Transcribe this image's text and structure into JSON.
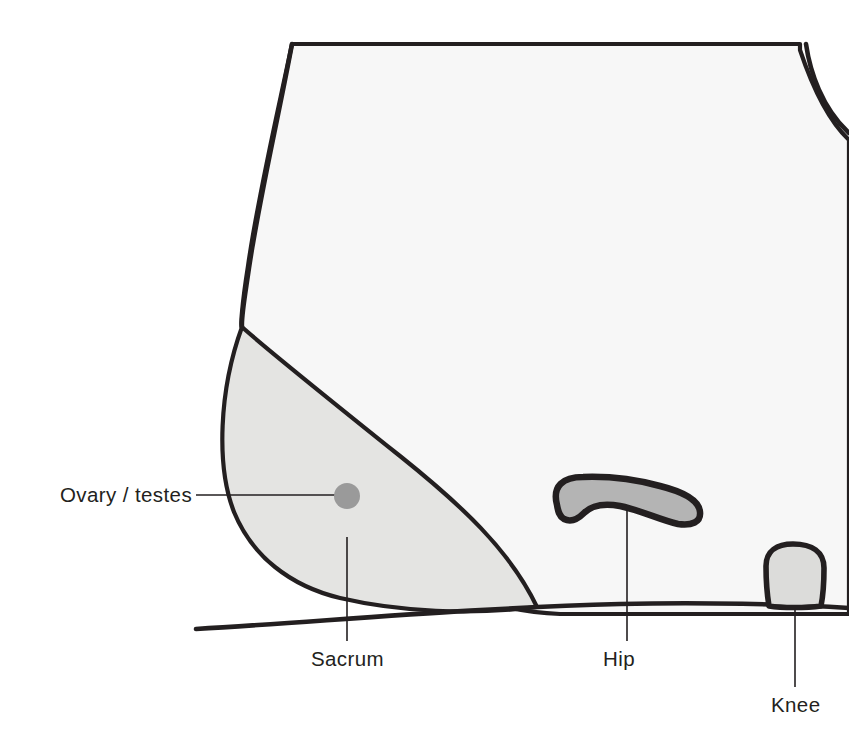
{
  "diagram": {
    "canvas": {
      "width": 849,
      "height": 751
    },
    "colors": {
      "outline": "#231f20",
      "body_fill": "#f7f7f7",
      "sacrum_fill": "#e4e4e2",
      "hip_fill": "#b4b4b4",
      "knee_fill": "#dcdcda",
      "ovary_fill": "#9a9a9a",
      "background": "#ffffff"
    },
    "labels": [
      {
        "id": "ovary-testes",
        "text": "Ovary / testes",
        "text_x": 60,
        "text_y": 502,
        "anchor": "start",
        "leader": "M196,495 L336,495"
      },
      {
        "id": "sacrum",
        "text": "Sacrum",
        "text_x": 311,
        "text_y": 666,
        "anchor": "start",
        "leader": "M347,537 L347,641"
      },
      {
        "id": "hip",
        "text": "Hip",
        "text_x": 603,
        "text_y": 666,
        "anchor": "start",
        "leader": "M627,488 L627,641"
      },
      {
        "id": "knee",
        "text": "Knee",
        "text_x": 771,
        "text_y": 712,
        "anchor": "start",
        "leader": "M795,570 L795,687"
      }
    ],
    "shapes": {
      "body": {
        "name": "torso-and-thigh-outline",
        "path": "M292,44 C276,120 258,196 248,266 C242,304 240,330 242,327 C250,420 300,520 420,578 C470,602 520,612 560,614 L849,614 L849,140 C828,120 812,86 800,50 L800,44 Z"
      },
      "body_top_curve": {
        "name": "torso-left-contour",
        "path": "M292,44 C277,124 259,200 249,268 C244,302 241,318 242,327"
      },
      "body_right_curve": {
        "name": "torso-right-contour",
        "path": "M806,44 C810,72 822,108 849,133"
      },
      "ground": {
        "name": "support-surface-line",
        "path": "M196,629 C330,621 470,608 620,604 C700,602 790,604 849,608"
      },
      "sacrum": {
        "name": "sacrum-region",
        "path": "M242,327 C270,352 330,400 400,456 C460,504 510,550 537,607 C470,615 400,612 340,598 C290,586 252,556 234,512 C216,466 219,390 242,327 Z"
      },
      "hip": {
        "name": "hip-region",
        "path": "M557,505 C552,486 563,477 583,477 C610,476 638,480 660,486 C684,492 699,500 700,512 C701,522 692,526 678,524 C660,520 640,510 620,506 C604,503 592,505 584,513 C577,520 570,522 564,519 C559,516 558,511 557,505 Z"
      },
      "knee": {
        "name": "knee-region",
        "path": "M766,566 C766,551 777,544 793,544 C812,544 824,552 824,568 C824,584 823,596 821,606 C806,608 782,608 769,606 C767,594 766,580 766,566 Z"
      },
      "ovary": {
        "name": "ovary-testes-marker",
        "cx": 347,
        "cy": 496,
        "r": 13
      }
    }
  }
}
